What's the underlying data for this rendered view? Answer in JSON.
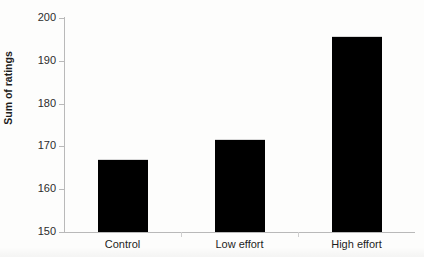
{
  "chart_data": {
    "type": "bar",
    "title": "",
    "subtitle": "",
    "xlabel": "",
    "ylabel": "Sum of ratings",
    "categories": [
      "Control",
      "Low effort",
      "High effort"
    ],
    "values": [
      166.8,
      171.4,
      195.6
    ],
    "ylim": [
      150,
      200
    ],
    "yticks": [
      150,
      160,
      170,
      180,
      190,
      200
    ],
    "ytick_labels": [
      "150",
      "160",
      "170",
      "180",
      "190",
      "200"
    ],
    "grid": false,
    "legend": null,
    "legend_position": "none",
    "bar_color": "#000000",
    "axis_color": "#b9b9b9",
    "text_color": "#1d1d1d",
    "annotations": []
  },
  "figure": {
    "background_color": "#fdfdfc"
  }
}
